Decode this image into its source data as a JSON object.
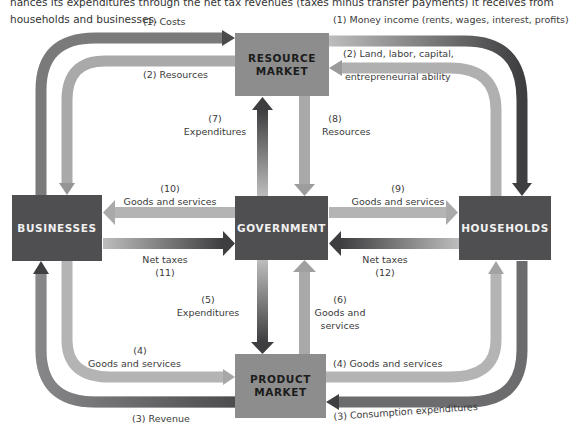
{
  "caption": "nances its expenditures through the net tax revenues (taxes minus transfer payments) it receives from households and businesses.",
  "boxes": {
    "resource_market": "RESOURCE MARKET",
    "businesses": "BUSINESSES",
    "government": "GOVERNMENT",
    "households": "HOUSEHOLDS",
    "product_market": "PRODUCT MARKET"
  },
  "flows": {
    "costs": "(1) Costs",
    "resources_2": "(2) Resources",
    "money_income": "(1) Money income (rents, wages, interest, profits)",
    "land_labor_1": "(2) Land, labor, capital,",
    "land_labor_2": "entrepreneurial ability",
    "f7_num": "(7)",
    "f7_label": "Expenditures",
    "f8_num": "(8)",
    "f8_label": "Resources",
    "f10_num": "(10)",
    "f10_label": "Goods and services",
    "f9_num": "(9)",
    "f9_label": "Goods and services",
    "f11_label": "Net taxes",
    "f11_num": "(11)",
    "f12_label": "Net taxes",
    "f12_num": "(12)",
    "f5_num": "(5)",
    "f5_label": "Expenditures",
    "f6_num": "(6)",
    "f6_label_1": "Goods and",
    "f6_label_2": "services",
    "f4_left_num": "(4)",
    "f4_left_label": "Goods and services",
    "f4_right": "(4) Goods and services",
    "revenue": "(3) Revenue",
    "consumption": "(3) Consumption expenditures"
  },
  "colors": {
    "dark_box": "#4f4f51",
    "light_box": "#8d8d8d",
    "arrow_dark": "#3e3e40",
    "arrow_light": "#b9b9b9"
  }
}
